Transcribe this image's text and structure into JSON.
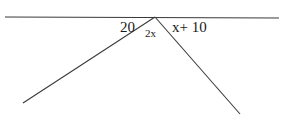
{
  "diagram": {
    "type": "angles-on-a-straight-line",
    "labels": {
      "left_angle": "20",
      "middle_angle": "2x",
      "right_angle": "x+ 10"
    },
    "colors": {
      "line": "#3a3a3a",
      "text": "#1a1a1a",
      "background": "#ffffff"
    }
  }
}
